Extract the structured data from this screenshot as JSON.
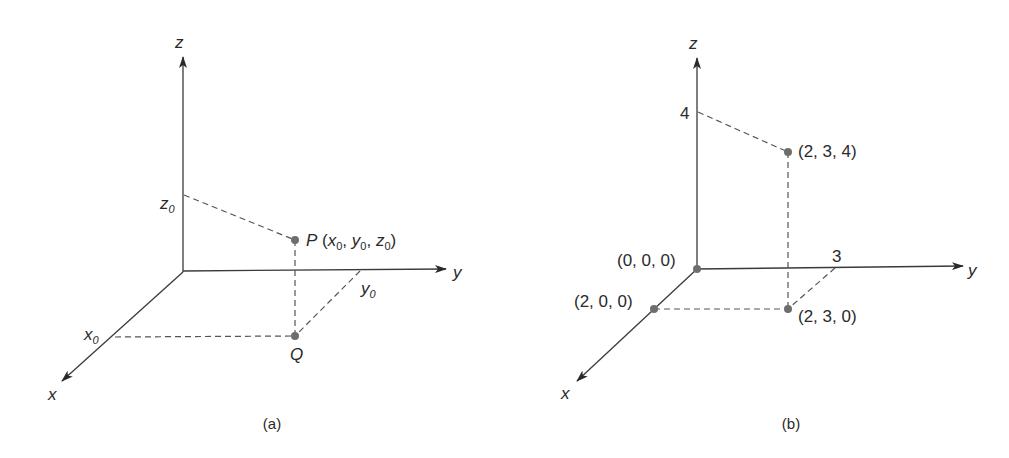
{
  "figure_a": {
    "caption": "(a)",
    "axes": {
      "x": "x",
      "y": "y",
      "z": "z"
    },
    "point_p": {
      "name": "P",
      "open": " (",
      "x": "x",
      "y": "y",
      "z": "z",
      "sub": "0",
      "sep": ", ",
      "close": ")"
    },
    "point_q": "Q",
    "ticks": {
      "x0": "x",
      "y0": "y",
      "z0": "z",
      "sub": "0"
    }
  },
  "figure_b": {
    "caption": "(b)",
    "axes": {
      "x": "x",
      "y": "y",
      "z": "z"
    },
    "tick_z": "4",
    "tick_y": "3",
    "points": {
      "origin": "(0, 0, 0)",
      "x_point": "(2, 0, 0)",
      "xy_point": "(2, 3, 0)",
      "xyz_point": "(2, 3, 4)"
    }
  },
  "colors": {
    "line": "#3a3a3a",
    "point": "#6e6e6e",
    "text": "#2a2a2a"
  }
}
